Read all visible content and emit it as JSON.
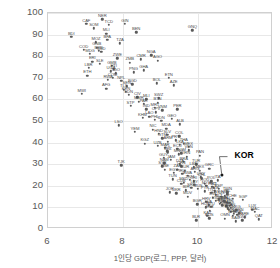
{
  "chart_data": {
    "type": "scatter",
    "title": "",
    "xlabel": "1인당 GDP(로그, PPP, 달러)",
    "ylabel": "전체 고용 중 취약고용 비중(%)",
    "xlim": [
      6,
      12
    ],
    "ylim": [
      0,
      100
    ],
    "xticks": [
      6,
      8,
      10,
      12
    ],
    "yticks": [
      0,
      10,
      20,
      30,
      40,
      50,
      60,
      70,
      80,
      90,
      100
    ],
    "grid": "horizontal-and-vertical",
    "legend": "none",
    "highlight": {
      "label": "KOR",
      "x": 10.63,
      "y": 25.0
    },
    "annotations": [
      {
        "text": "KOR",
        "x": 11.0,
        "y": 33.5,
        "bold": true,
        "leader_to": {
          "x": 10.63,
          "y": 25.6
        }
      }
    ],
    "points": [
      {
        "label": "NER",
        "x": 7.45,
        "y": 97.0
      },
      {
        "label": "CAF",
        "x": 7.02,
        "y": 95.0
      },
      {
        "label": "TCD",
        "x": 7.62,
        "y": 94.5
      },
      {
        "label": "GIN",
        "x": 8.05,
        "y": 95.0
      },
      {
        "label": "SOM",
        "x": 7.22,
        "y": 93.0
      },
      {
        "label": "BEN",
        "x": 8.35,
        "y": 91.0
      },
      {
        "label": "BDI",
        "x": 6.62,
        "y": 89.0
      },
      {
        "label": "MLI",
        "x": 7.55,
        "y": 90.5
      },
      {
        "label": "MOZ",
        "x": 7.28,
        "y": 86.5
      },
      {
        "label": "BFA",
        "x": 7.58,
        "y": 87.5
      },
      {
        "label": "TZA",
        "x": 7.92,
        "y": 86.0
      },
      {
        "label": "GNQ",
        "x": 9.85,
        "y": 92.0
      },
      {
        "label": "COD",
        "x": 6.95,
        "y": 83.0
      },
      {
        "label": "BRB",
        "x": 7.35,
        "y": 82.5
      },
      {
        "label": "MDG",
        "x": 7.12,
        "y": 81.0
      },
      {
        "label": "NGA",
        "x": 8.75,
        "y": 80.5
      },
      {
        "label": "CMR",
        "x": 8.48,
        "y": 78.5
      },
      {
        "label": "AGO",
        "x": 8.92,
        "y": 78.0
      },
      {
        "label": "SLE",
        "x": 7.38,
        "y": 76.5
      },
      {
        "label": "GMB",
        "x": 7.7,
        "y": 75.5
      },
      {
        "label": "HTI",
        "x": 7.75,
        "y": 74.0
      },
      {
        "label": "UGA",
        "x": 7.68,
        "y": 73.0
      },
      {
        "label": "GHA",
        "x": 8.55,
        "y": 73.5
      },
      {
        "label": "TGO",
        "x": 7.8,
        "y": 72.0
      },
      {
        "label": "ETH",
        "x": 7.05,
        "y": 71.0
      },
      {
        "label": "RWA",
        "x": 7.6,
        "y": 69.0
      },
      {
        "label": "NPL",
        "x": 7.95,
        "y": 68.5
      },
      {
        "label": "BGD",
        "x": 8.25,
        "y": 67.0
      },
      {
        "label": "SEN",
        "x": 8.1,
        "y": 66.0
      },
      {
        "label": "ETN",
        "x": 9.22,
        "y": 70.0
      },
      {
        "label": "BOL",
        "x": 8.9,
        "y": 67.5
      },
      {
        "label": "AZE",
        "x": 9.35,
        "y": 66.5
      },
      {
        "label": "MWI",
        "x": 6.9,
        "y": 62.5
      },
      {
        "label": "SDN",
        "x": 8.15,
        "y": 62.0
      },
      {
        "label": "CIV",
        "x": 8.38,
        "y": 61.0
      },
      {
        "label": "MLI2",
        "x": 8.62,
        "y": 60.0
      },
      {
        "label": "PAK",
        "x": 8.55,
        "y": 58.0
      },
      {
        "label": "IND",
        "x": 8.62,
        "y": 55.5
      },
      {
        "label": "MRT",
        "x": 8.85,
        "y": 56.0
      },
      {
        "label": "VNM",
        "x": 9.05,
        "y": 55.0
      },
      {
        "label": "PER",
        "x": 9.45,
        "y": 55.5
      },
      {
        "label": "KHM",
        "x": 8.52,
        "y": 51.5
      },
      {
        "label": "LAO",
        "x": 8.7,
        "y": 52.0
      },
      {
        "label": "PHL",
        "x": 8.85,
        "y": 50.5
      },
      {
        "label": "IDN",
        "x": 9.02,
        "y": 50.0
      },
      {
        "label": "LSO",
        "x": 7.88,
        "y": 48.0
      },
      {
        "label": "NIC",
        "x": 8.8,
        "y": 46.0
      },
      {
        "label": "MDA",
        "x": 9.15,
        "y": 46.5
      },
      {
        "label": "HND",
        "x": 8.95,
        "y": 44.0
      },
      {
        "label": "COL",
        "x": 9.5,
        "y": 43.0
      },
      {
        "label": "GTM",
        "x": 9.05,
        "y": 42.0
      },
      {
        "label": "PRY",
        "x": 9.4,
        "y": 41.0
      },
      {
        "label": "MEX",
        "x": 9.75,
        "y": 38.0
      },
      {
        "label": "THA",
        "x": 9.62,
        "y": 39.5
      },
      {
        "label": "ECU",
        "x": 9.45,
        "y": 37.0
      },
      {
        "label": "DOM",
        "x": 9.55,
        "y": 35.0
      },
      {
        "label": "PAN",
        "x": 10.05,
        "y": 34.0
      },
      {
        "label": "TJK",
        "x": 7.95,
        "y": 29.5
      },
      {
        "label": "BRA",
        "x": 9.62,
        "y": 31.0
      },
      {
        "label": "TUR",
        "x": 9.95,
        "y": 30.0
      },
      {
        "label": "CHN",
        "x": 9.55,
        "y": 29.0
      },
      {
        "label": "ZAF",
        "x": 9.45,
        "y": 27.5
      },
      {
        "label": "ARG",
        "x": 9.92,
        "y": 26.5
      },
      {
        "label": "GRC",
        "x": 10.3,
        "y": 28.0
      },
      {
        "label": "MEX2",
        "x": 10.05,
        "y": 27.0
      },
      {
        "label": "KOR",
        "x": 10.63,
        "y": 25.0
      },
      {
        "label": "ITA",
        "x": 10.52,
        "y": 22.5
      },
      {
        "label": "POL",
        "x": 10.35,
        "y": 22.0
      },
      {
        "label": "CHL",
        "x": 10.1,
        "y": 23.5
      },
      {
        "label": "ROU",
        "x": 10.18,
        "y": 21.0
      },
      {
        "label": "PRT",
        "x": 10.38,
        "y": 19.5
      },
      {
        "label": "ESP",
        "x": 10.55,
        "y": 18.5
      },
      {
        "label": "CZE",
        "x": 10.45,
        "y": 17.5
      },
      {
        "label": "IRL",
        "x": 10.78,
        "y": 16.0
      },
      {
        "label": "NLD",
        "x": 10.72,
        "y": 15.5
      },
      {
        "label": "CHE",
        "x": 10.92,
        "y": 14.0
      },
      {
        "label": "SGP",
        "x": 11.2,
        "y": 13.5
      },
      {
        "label": "GBR",
        "x": 10.68,
        "y": 13.0
      },
      {
        "label": "JPN",
        "x": 10.6,
        "y": 12.0
      },
      {
        "label": "FRA",
        "x": 10.65,
        "y": 11.0
      },
      {
        "label": "DEU",
        "x": 10.75,
        "y": 10.5
      },
      {
        "label": "SWE",
        "x": 10.8,
        "y": 9.5
      },
      {
        "label": "AUT",
        "x": 10.82,
        "y": 9.0
      },
      {
        "label": "DNK",
        "x": 10.88,
        "y": 8.0
      },
      {
        "label": "USA",
        "x": 10.95,
        "y": 7.0
      },
      {
        "label": "NOR",
        "x": 11.05,
        "y": 6.5
      },
      {
        "label": "LUX",
        "x": 11.45,
        "y": 9.0
      },
      {
        "label": "MAC",
        "x": 11.52,
        "y": 8.0
      },
      {
        "label": "QAT",
        "x": 11.62,
        "y": 4.5
      },
      {
        "label": "BLR",
        "x": 9.95,
        "y": 4.0
      },
      {
        "label": "KAZ",
        "x": 10.25,
        "y": 6.0
      },
      {
        "label": "RUS",
        "x": 10.3,
        "y": 5.0
      },
      {
        "label": "UKR",
        "x": 9.42,
        "y": 16.5
      },
      {
        "label": "SRB",
        "x": 9.82,
        "y": 19.0
      },
      {
        "label": "BGR",
        "x": 9.98,
        "y": 11.5
      },
      {
        "label": "HRV",
        "x": 10.22,
        "y": 12.5
      },
      {
        "label": "HUN",
        "x": 10.2,
        "y": 10.0
      },
      {
        "label": "EST",
        "x": 10.32,
        "y": 8.5
      },
      {
        "label": "LVA",
        "x": 10.28,
        "y": 11.0
      },
      {
        "label": "SVK",
        "x": 10.4,
        "y": 14.5
      },
      {
        "label": "SVN",
        "x": 10.48,
        "y": 13.0
      },
      {
        "label": "FIN",
        "x": 10.7,
        "y": 12.8
      },
      {
        "label": "BEL",
        "x": 10.78,
        "y": 12.2
      },
      {
        "label": "ISR",
        "x": 10.58,
        "y": 11.8
      },
      {
        "label": "NZL",
        "x": 10.62,
        "y": 15.0
      },
      {
        "label": "AUS",
        "x": 10.85,
        "y": 10.8
      },
      {
        "label": "CAN",
        "x": 10.88,
        "y": 9.8
      },
      {
        "label": "ARE",
        "x": 11.25,
        "y": 5.5
      },
      {
        "label": "KWT",
        "x": 11.18,
        "y": 4.0
      },
      {
        "label": "SAU",
        "x": 11.0,
        "y": 3.5
      },
      {
        "label": "OMN",
        "x": 10.72,
        "y": 4.8
      },
      {
        "label": "URY",
        "x": 10.08,
        "y": 24.0
      },
      {
        "label": "CRI",
        "x": 9.88,
        "y": 22.0
      },
      {
        "label": "MYS",
        "x": 10.22,
        "y": 20.0
      },
      {
        "label": "JOR",
        "x": 9.25,
        "y": 17.0
      },
      {
        "label": "EGY",
        "x": 9.35,
        "y": 26.0
      },
      {
        "label": "MAR",
        "x": 9.12,
        "y": 37.5
      },
      {
        "label": "TUN",
        "x": 9.32,
        "y": 23.0
      },
      {
        "label": "IRN",
        "x": 9.7,
        "y": 33.5
      },
      {
        "label": "LKA",
        "x": 9.52,
        "y": 39.0
      },
      {
        "label": "MNG",
        "x": 9.48,
        "y": 34.5
      },
      {
        "label": "UZB",
        "x": 8.92,
        "y": 38.5
      },
      {
        "label": "KGZ",
        "x": 8.58,
        "y": 39.5
      },
      {
        "label": "ARM",
        "x": 9.2,
        "y": 40.5
      },
      {
        "label": "GEO",
        "x": 9.3,
        "y": 51.0
      },
      {
        "label": "ALB",
        "x": 9.52,
        "y": 48.5
      },
      {
        "label": "MKD",
        "x": 9.62,
        "y": 21.5
      },
      {
        "label": "BIH",
        "x": 9.68,
        "y": 18.0
      },
      {
        "label": "SLV",
        "x": 9.18,
        "y": 43.5
      },
      {
        "label": "JAM",
        "x": 9.28,
        "y": 32.0
      },
      {
        "label": "ZMB",
        "x": 8.18,
        "y": 77.0
      },
      {
        "label": "ZWE",
        "x": 7.85,
        "y": 79.0
      },
      {
        "label": "KEN",
        "x": 8.08,
        "y": 63.5
      },
      {
        "label": "NAM",
        "x": 9.1,
        "y": 30.5
      },
      {
        "label": "BWA",
        "x": 9.72,
        "y": 24.5
      },
      {
        "label": "MUS",
        "x": 10.0,
        "y": 18.5
      },
      {
        "label": "TTO",
        "x": 10.35,
        "y": 16.8
      },
      {
        "label": "LBN",
        "x": 9.88,
        "y": 28.5
      },
      {
        "label": "IRQ",
        "x": 9.58,
        "y": 25.5
      },
      {
        "label": "DZA",
        "x": 9.52,
        "y": 30.0
      },
      {
        "label": "LBY",
        "x": 9.9,
        "y": 20.5
      },
      {
        "label": "SYR",
        "x": 9.05,
        "y": 29.0
      },
      {
        "label": "YEM",
        "x": 8.32,
        "y": 45.0
      },
      {
        "label": "AFG",
        "x": 7.55,
        "y": 65.0
      },
      {
        "label": "MMR",
        "x": 8.42,
        "y": 59.0
      },
      {
        "label": "PNG",
        "x": 8.28,
        "y": 72.5
      },
      {
        "label": "TLS",
        "x": 8.02,
        "y": 64.5
      },
      {
        "label": "FJI",
        "x": 9.18,
        "y": 36.0
      },
      {
        "label": "SUR",
        "x": 9.65,
        "y": 27.0
      },
      {
        "label": "GUY",
        "x": 9.08,
        "y": 33.0
      },
      {
        "label": "BLZ",
        "x": 9.2,
        "y": 35.5
      },
      {
        "label": "CUB",
        "x": 9.55,
        "y": 20.8
      },
      {
        "label": "VEN",
        "x": 9.75,
        "y": 36.5
      },
      {
        "label": "LTU",
        "x": 10.35,
        "y": 10.2
      },
      {
        "label": "CYP",
        "x": 10.48,
        "y": 15.8
      },
      {
        "label": "MLT",
        "x": 10.55,
        "y": 13.8
      },
      {
        "label": "ISL",
        "x": 10.85,
        "y": 12.0
      },
      {
        "label": "BHR",
        "x": 10.92,
        "y": 6.2
      },
      {
        "label": "BRN",
        "x": 11.1,
        "y": 7.2
      },
      {
        "label": "HKG",
        "x": 11.02,
        "y": 8.8
      },
      {
        "label": "TWN",
        "x": 10.78,
        "y": 17.0
      },
      {
        "label": "SWZ",
        "x": 8.95,
        "y": 60.5
      },
      {
        "label": "CPV",
        "x": 8.88,
        "y": 54.0
      },
      {
        "label": "STP",
        "x": 8.2,
        "y": 57.0
      },
      {
        "label": "COM",
        "x": 7.72,
        "y": 70.0
      },
      {
        "label": "GNB",
        "x": 7.3,
        "y": 84.0
      },
      {
        "label": "ERI",
        "x": 7.18,
        "y": 77.5
      },
      {
        "label": "LBR",
        "x": 7.08,
        "y": 74.5
      },
      {
        "label": "SSD",
        "x": 7.42,
        "y": 82.0
      },
      {
        "label": "BTN",
        "x": 8.92,
        "y": 58.5
      },
      {
        "label": "MDV",
        "x": 9.72,
        "y": 15.0
      },
      {
        "label": "TKM",
        "x": 9.78,
        "y": 22.8
      },
      {
        "label": "PSE",
        "x": 9.12,
        "y": 27.5
      },
      {
        "label": "NCL",
        "x": 10.42,
        "y": 19.2
      },
      {
        "label": "PYF",
        "x": 10.18,
        "y": 17.5
      }
    ]
  }
}
